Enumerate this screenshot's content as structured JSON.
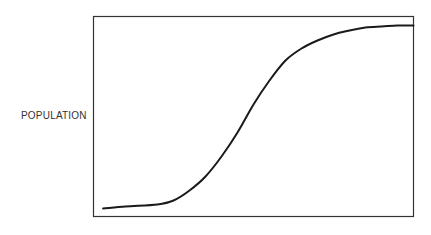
{
  "chart_data": {
    "type": "line",
    "title": "",
    "xlabel": "",
    "ylabel": "POPULATION",
    "grid": false,
    "legend": null,
    "x_ticks": [],
    "y_ticks": [],
    "xlim": [
      0,
      1
    ],
    "ylim": [
      0,
      1
    ],
    "series": [
      {
        "name": "Population growth (logistic S-curve)",
        "x": [
          0.03,
          0.1,
          0.2,
          0.25,
          0.3,
          0.35,
          0.4,
          0.45,
          0.5,
          0.55,
          0.6,
          0.65,
          0.7,
          0.75,
          0.8,
          0.85,
          0.9,
          0.95,
          1.0
        ],
        "y": [
          0.04,
          0.05,
          0.06,
          0.08,
          0.13,
          0.2,
          0.3,
          0.42,
          0.56,
          0.68,
          0.78,
          0.84,
          0.88,
          0.91,
          0.93,
          0.945,
          0.95,
          0.955,
          0.955
        ]
      }
    ]
  },
  "colors": {
    "curve": "#1a1a1a",
    "frame": "#333333",
    "label": "#333333",
    "background": "#ffffff"
  }
}
